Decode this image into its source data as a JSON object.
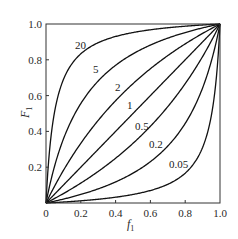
{
  "chart_data": {
    "type": "line",
    "title": "",
    "xlabel": "f",
    "xlabel_sub": "1",
    "ylabel": "F",
    "ylabel_sub": "1",
    "xlim": [
      0,
      1.0
    ],
    "ylim": [
      0,
      1.0
    ],
    "grid": false,
    "legend": "inline curve labels",
    "x_ticks": [
      "0",
      "0.2",
      "0.4",
      "0.6",
      "0.8",
      "1.0"
    ],
    "x_tick_values": [
      0,
      0.2,
      0.4,
      0.6,
      0.8,
      1.0
    ],
    "y_ticks": [
      "0.2",
      "0.4",
      "0.6",
      "0.8",
      "1.0"
    ],
    "y_tick_values": [
      0.2,
      0.4,
      0.6,
      0.8,
      1.0
    ],
    "formula": "F1 = r*f1 / (r*f1 + (1 - f1))",
    "x": [
      0,
      0.05,
      0.1,
      0.2,
      0.3,
      0.4,
      0.5,
      0.6,
      0.7,
      0.8,
      0.9,
      0.95,
      1.0
    ],
    "series": [
      {
        "name": "20",
        "r": 20,
        "values": [
          0,
          0.513,
          0.69,
          0.833,
          0.896,
          0.93,
          0.952,
          0.968,
          0.979,
          0.988,
          0.994,
          0.997,
          1.0
        ],
        "label_pos": [
          75,
          49
        ]
      },
      {
        "name": "5",
        "r": 5,
        "values": [
          0,
          0.208,
          0.357,
          0.556,
          0.682,
          0.769,
          0.833,
          0.882,
          0.921,
          0.952,
          0.978,
          0.99,
          1.0
        ],
        "label_pos": [
          93,
          73
        ]
      },
      {
        "name": "2",
        "r": 2,
        "values": [
          0,
          0.095,
          0.182,
          0.333,
          0.462,
          0.571,
          0.667,
          0.75,
          0.824,
          0.889,
          0.947,
          0.974,
          1.0
        ],
        "label_pos": [
          115,
          91
        ]
      },
      {
        "name": "1",
        "r": 1,
        "values": [
          0,
          0.05,
          0.1,
          0.2,
          0.3,
          0.4,
          0.5,
          0.6,
          0.7,
          0.8,
          0.9,
          0.95,
          1.0
        ],
        "label_pos": [
          127,
          109
        ]
      },
      {
        "name": "0.5",
        "r": 0.5,
        "values": [
          0,
          0.026,
          0.053,
          0.111,
          0.176,
          0.25,
          0.333,
          0.429,
          0.538,
          0.667,
          0.818,
          0.905,
          1.0
        ],
        "label_pos": [
          135,
          130
        ]
      },
      {
        "name": "0.2",
        "r": 0.2,
        "values": [
          0,
          0.01,
          0.022,
          0.048,
          0.079,
          0.118,
          0.167,
          0.231,
          0.318,
          0.444,
          0.643,
          0.792,
          1.0
        ],
        "label_pos": [
          149,
          148
        ]
      },
      {
        "name": "0.05",
        "r": 0.05,
        "values": [
          0,
          0.003,
          0.006,
          0.012,
          0.021,
          0.032,
          0.048,
          0.07,
          0.104,
          0.167,
          0.31,
          0.487,
          1.0
        ],
        "label_pos": [
          169,
          168
        ]
      }
    ],
    "line_color": "#111111",
    "plot_box": {
      "left": 46,
      "top": 24,
      "right": 220,
      "bottom": 203
    }
  }
}
